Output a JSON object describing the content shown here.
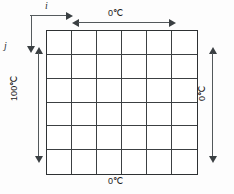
{
  "figure": {
    "grid": {
      "rows": 6,
      "columns": 6,
      "line_color": "#3c4042",
      "border_color": "#2e3133",
      "fill_color": "#ffffff"
    },
    "axes": {
      "horizontal_label": "i",
      "vertical_label": "j"
    },
    "boundary_conditions": {
      "top": "0℃",
      "bottom": "0℃",
      "left": "100℃",
      "right": "0℃"
    },
    "dimension_arrows": {
      "top": "double-headed-horizontal-arrow",
      "left": "double-headed-vertical-arrow",
      "right": "double-headed-vertical-arrow"
    }
  }
}
